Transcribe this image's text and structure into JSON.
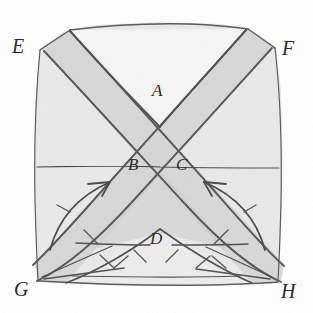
{
  "figure": {
    "kind": "hand-drawn-geometric-diagram",
    "caption_absent": true,
    "paper_color": "#ffffff",
    "ink_color": "#4a4a4a",
    "ink_dark_color": "#3a3a3a",
    "labels": {
      "A": "A",
      "B": "B",
      "C": "C",
      "D": "D",
      "E": "E",
      "F": "F",
      "G": "G",
      "H": "H"
    },
    "label_roles": {
      "A": "upper-notch-vertex",
      "B": "left-of-crossing-point",
      "C": "right-of-crossing-point",
      "D": "lower-peak-vertex",
      "E": "top-left-corner",
      "F": "top-right-corner",
      "G": "bottom-left-corner",
      "H": "bottom-right-corner"
    },
    "shading": {
      "plate_fill": "#e8e8e8",
      "band_fill": "#d4d4d4",
      "light_fill": "#f2f2f2",
      "notch_fill": "#f7f7f7",
      "dark_fill": "#cfcfcf"
    },
    "elements": {
      "outline": "square-plate-with-irregular-hand-drawn-edges",
      "diagonal_band_1": "band-from-top-left-E-to-bottom-right-H",
      "diagonal_band_2": "band-from-top-right-F-to-bottom-left-G",
      "horizontal_line": "horizontal-line-through-crossing-at-B-and-C",
      "arrow_left": "curved-arrow-pointing-up-and-right",
      "arrow_right": "curved-arrow-pointing-up-and-left",
      "notch_top": "v-shaped-notch-at-A",
      "peak_bottom": "triangular-peak-at-D",
      "hatching": "short-hatch-tick-marks-along-lower-diagonals"
    }
  }
}
